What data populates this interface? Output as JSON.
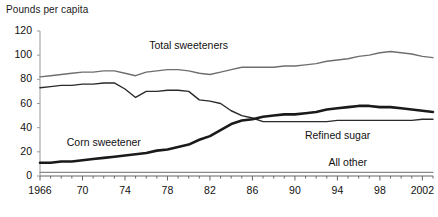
{
  "chart_data": {
    "type": "line",
    "title": "Pounds per capita",
    "xlabel": "",
    "ylabel": "Pounds per capita",
    "ylim": [
      0,
      120
    ],
    "yticks": [
      0,
      20,
      40,
      60,
      80,
      100,
      120
    ],
    "xlim": [
      1966,
      2003
    ],
    "xticks": [
      1966,
      1970,
      1974,
      1978,
      1982,
      1986,
      1990,
      1994,
      1998,
      2002
    ],
    "xtick_labels": [
      "1966",
      "70",
      "74",
      "78",
      "82",
      "86",
      "90",
      "94",
      "98",
      "2002"
    ],
    "grid": false,
    "legend": "inline-annotations",
    "x": [
      1966,
      1967,
      1968,
      1969,
      1970,
      1971,
      1972,
      1973,
      1974,
      1975,
      1976,
      1977,
      1978,
      1979,
      1980,
      1981,
      1982,
      1983,
      1984,
      1985,
      1986,
      1987,
      1988,
      1989,
      1990,
      1991,
      1992,
      1993,
      1994,
      1995,
      1996,
      1997,
      1998,
      1999,
      2000,
      2001,
      2002,
      2003
    ],
    "series": [
      {
        "name": "Total sweeteners",
        "color": "#6e6e6e",
        "width": 1.4,
        "label_x": 1980,
        "label_y": 108,
        "values": [
          82,
          83,
          84,
          85,
          86,
          86,
          87,
          87,
          85,
          83,
          86,
          87,
          88,
          88,
          87,
          85,
          84,
          86,
          88,
          90,
          90,
          90,
          90,
          91,
          91,
          92,
          93,
          95,
          96,
          97,
          99,
          100,
          102,
          103,
          102,
          101,
          99,
          98
        ]
      },
      {
        "name": "Refined sugar",
        "color": "#2a2a2a",
        "width": 1.4,
        "label_x": 1994,
        "label_y": 33,
        "values": [
          73,
          74,
          75,
          75,
          76,
          76,
          77,
          77,
          72,
          65,
          70,
          70,
          71,
          71,
          70,
          63,
          62,
          60,
          54,
          50,
          48,
          45,
          45,
          45,
          45,
          45,
          45,
          45,
          46,
          46,
          46,
          46,
          46,
          46,
          46,
          46,
          47,
          47
        ]
      },
      {
        "name": "Corn sweetener",
        "color": "#1a1a1a",
        "width": 2.6,
        "label_x": 1972,
        "label_y": 27,
        "values": [
          11,
          11,
          12,
          12,
          13,
          14,
          15,
          16,
          17,
          18,
          19,
          21,
          22,
          24,
          26,
          30,
          33,
          38,
          43,
          46,
          47,
          49,
          50,
          51,
          51,
          52,
          53,
          55,
          56,
          57,
          58,
          58,
          57,
          57,
          56,
          55,
          54,
          53
        ]
      },
      {
        "name": "All other",
        "color": "#8a8a8a",
        "width": 1.2,
        "label_x": 1995,
        "label_y": 11,
        "values": [
          3,
          3,
          3,
          3,
          3,
          3,
          3,
          3,
          3,
          3,
          3,
          3,
          3,
          3,
          3,
          3,
          3,
          3,
          3,
          3,
          3,
          3,
          3,
          3,
          3,
          3,
          3,
          3,
          3,
          3,
          3,
          3,
          3,
          3,
          3,
          3,
          3,
          3
        ]
      }
    ]
  },
  "axis": {
    "y_axis_color": "#999999",
    "x_axis_color": "#666666"
  }
}
